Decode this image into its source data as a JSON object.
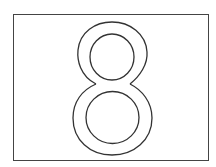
{
  "card": {
    "digit": "8",
    "stroke_color": "#333333",
    "border_color": "#444444",
    "background": "#ffffff"
  }
}
